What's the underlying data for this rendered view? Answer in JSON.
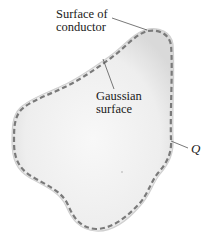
{
  "figure": {
    "type": "physics-diagram",
    "colors": {
      "background": "#ffffff",
      "conductor_fill": "#ececec",
      "conductor_fill_center": "#f7f7f7",
      "conductor_edge": "#c8c8c8",
      "gaussian_dash": "#7a7a7a",
      "leader_line": "#555555",
      "text": "#1a1a1a"
    },
    "labels": {
      "conductor_line1": "Surface of",
      "conductor_line2": "conductor",
      "gaussian_line1": "Gaussian",
      "gaussian_line2": "surface",
      "charge": "Q"
    }
  }
}
